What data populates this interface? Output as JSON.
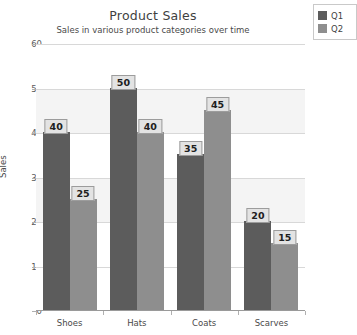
{
  "chart_data": {
    "type": "bar",
    "title": "Product Sales",
    "subtitle": "Sales in various product categories over time",
    "xlabel": "",
    "ylabel": "Sales",
    "categories": [
      "Shoes",
      "Hats",
      "Coats",
      "Scarves"
    ],
    "series": [
      {
        "name": "Q1",
        "values": [
          40,
          50,
          35,
          20
        ],
        "color": "#5c5c5c"
      },
      {
        "name": "Q2",
        "values": [
          25,
          40,
          45,
          15
        ],
        "color": "#8e8e8e"
      }
    ],
    "ylim": [
      0,
      60
    ],
    "yticks": [
      0,
      10,
      20,
      30,
      40,
      50,
      60
    ],
    "ytick_labels": [
      "0",
      "10",
      "20",
      "30",
      "40",
      "50",
      "60"
    ],
    "grid": true,
    "legend_position": "top-right",
    "data_labels": true
  },
  "legend": {
    "entries": [
      {
        "label": "Q1"
      },
      {
        "label": "Q2"
      }
    ]
  },
  "colors": {
    "q1": "#5c5c5c",
    "q2": "#8e8e8e",
    "band": "#f4f4f4",
    "gridline": "#d8d8d8",
    "label_box_bg": "#e3e3e3",
    "label_box_border": "#9c9c9c"
  }
}
